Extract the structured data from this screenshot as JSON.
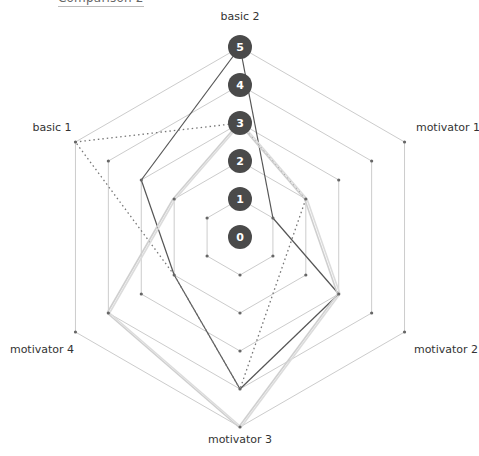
{
  "heading": "Comparison 2",
  "chart_data": {
    "type": "radar",
    "title": "Comparison 2",
    "axes": [
      "basic 2",
      "motivator 1",
      "motivator 2",
      "motivator 3",
      "motivator 4",
      "basic 1"
    ],
    "levels": [
      0,
      1,
      2,
      3,
      4,
      5
    ],
    "range": [
      0,
      5
    ],
    "series": [
      {
        "name": "series A (dark solid)",
        "style": "solid",
        "color": "#555555",
        "values": [
          5,
          1,
          3,
          4,
          2,
          3
        ]
      },
      {
        "name": "series B (dotted)",
        "style": "dotted",
        "color": "#777777",
        "values": [
          3,
          2,
          null,
          4,
          2,
          5
        ]
      },
      {
        "name": "series C (light)",
        "style": "light",
        "color": "#cfcfcf",
        "values": [
          3,
          2,
          3,
          5,
          4,
          2
        ]
      },
      {
        "name": "series D (light)",
        "style": "light",
        "color": "#dcdcdc",
        "values": [
          3,
          2,
          3,
          5,
          4,
          2
        ]
      }
    ],
    "grid": true,
    "legend": "none"
  },
  "colors": {
    "grid": "#cccccc",
    "vertex": "#666666",
    "level_badge": "#4a4a4a"
  }
}
